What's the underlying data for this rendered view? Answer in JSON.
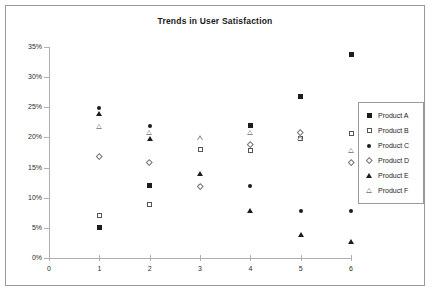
{
  "chart_data": {
    "type": "scatter",
    "title": "Trends in User Satisfaction",
    "xlabel": "",
    "ylabel": "",
    "xlim": [
      0,
      6
    ],
    "ylim": [
      0,
      35
    ],
    "grid": false,
    "legend_position": "right",
    "x_ticks": [
      "0",
      "1",
      "2",
      "3",
      "4",
      "5",
      "6"
    ],
    "y_ticks": [
      "0%",
      "5%",
      "10%",
      "15%",
      "20%",
      "25%",
      "30%",
      "35%"
    ],
    "x": [
      1,
      2,
      3,
      4,
      5,
      6
    ],
    "series": [
      {
        "name": "Product A",
        "marker": "filled-square",
        "values": [
          5.0,
          12.0,
          18.0,
          22.0,
          26.8,
          33.8
        ]
      },
      {
        "name": "Product B",
        "marker": "open-square",
        "values": [
          7.0,
          8.8,
          18.0,
          17.8,
          19.9,
          20.7
        ]
      },
      {
        "name": "Product C",
        "marker": "filled-circle",
        "values": [
          24.9,
          21.9,
          11.9,
          11.9,
          7.8,
          7.8
        ]
      },
      {
        "name": "Product D",
        "marker": "open-diamond",
        "values": [
          16.9,
          15.9,
          11.9,
          18.8,
          20.8,
          15.8
        ]
      },
      {
        "name": "Product E",
        "marker": "filled-triangle",
        "values": [
          23.9,
          19.7,
          13.9,
          7.8,
          3.8,
          2.7
        ]
      },
      {
        "name": "Product F",
        "marker": "open-triangle",
        "values": [
          21.8,
          20.8,
          19.9,
          20.8,
          19.9,
          17.8
        ]
      }
    ]
  }
}
